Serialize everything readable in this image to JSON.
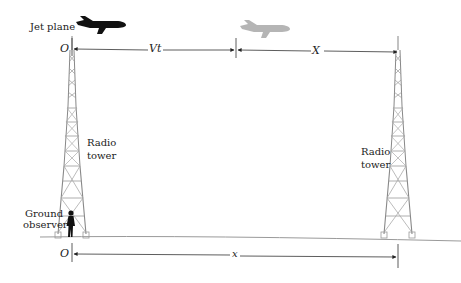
{
  "labels": {
    "jet_plane": "Jet plane",
    "origin_top": "O",
    "origin_bottom": "O",
    "vt": "Vt",
    "X": "X",
    "x": "x",
    "tower_left_1": "Radio",
    "tower_left_2": "tower",
    "tower_right_1": "Radio",
    "tower_right_2": "tower",
    "observer_1": "Ground",
    "observer_2": "observer"
  },
  "colors": {
    "plane_solid": "#111111",
    "plane_ghost": "#b5b5b5",
    "line": "#333333",
    "tower": "#8a8a8a",
    "ground": "#9a9a9a"
  }
}
